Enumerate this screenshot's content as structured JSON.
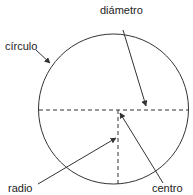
{
  "diagram": {
    "labels": {
      "diameter": "diámetro",
      "circle": "círculo",
      "radius": "radio",
      "center": "centro"
    },
    "colors": {
      "stroke": "#333333",
      "text": "#222222",
      "background": "#ffffff"
    }
  }
}
